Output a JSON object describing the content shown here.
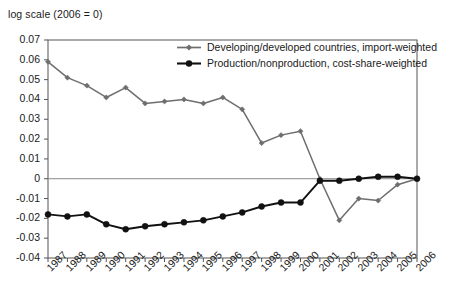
{
  "caption": "log scale (2006 = 0)",
  "legend": {
    "position": "top-center-right",
    "items": [
      {
        "label": "Developing/developed countries, import-weighted",
        "color": "#6e6e6e",
        "marker": "diamond",
        "icon": "line-marker-icon"
      },
      {
        "label": "Production/nonproduction, cost-share-weighted",
        "color": "#111111",
        "marker": "circle",
        "icon": "line-marker-icon"
      }
    ]
  },
  "chart_data": {
    "type": "line",
    "title": "",
    "subtitle": "",
    "xlabel": "",
    "ylabel": "log scale (2006 = 0)",
    "grid": false,
    "zero_line": true,
    "xlim": [
      1987,
      2006
    ],
    "ylim": [
      -0.04,
      0.07
    ],
    "ytick_labels": [
      "0.07",
      "0.06",
      "0.05",
      "0.04",
      "0.03",
      "0.02",
      "0.01",
      "0",
      "-0.01",
      "-0.02",
      "-0.03",
      "-0.04"
    ],
    "ytick_values": [
      0.07,
      0.06,
      0.05,
      0.04,
      0.03,
      0.02,
      0.01,
      0,
      -0.01,
      -0.02,
      -0.03,
      -0.04
    ],
    "categories": [
      "1987",
      "1988",
      "1989",
      "1990",
      "1991",
      "1992",
      "1993",
      "1994",
      "1995",
      "1996",
      "1997",
      "1998",
      "1999",
      "2000",
      "2001",
      "2002",
      "2003",
      "2004",
      "2005",
      "2006"
    ],
    "x": [
      1987,
      1988,
      1989,
      1990,
      1991,
      1992,
      1993,
      1994,
      1995,
      1996,
      1997,
      1998,
      1999,
      2000,
      2001,
      2002,
      2003,
      2004,
      2005,
      2006
    ],
    "series": [
      {
        "name": "Developing/developed countries, import-weighted",
        "color": "#6e6e6e",
        "marker": "diamond",
        "values": [
          0.059,
          0.051,
          0.047,
          0.041,
          0.046,
          0.038,
          0.039,
          0.04,
          0.038,
          0.041,
          0.035,
          0.018,
          0.022,
          0.024,
          0.0,
          -0.021,
          -0.01,
          -0.011,
          -0.003,
          0.0
        ]
      },
      {
        "name": "Production/nonproduction, cost-share-weighted",
        "color": "#111111",
        "marker": "circle",
        "values": [
          -0.018,
          -0.019,
          -0.018,
          -0.023,
          -0.0255,
          -0.024,
          -0.023,
          -0.022,
          -0.021,
          -0.019,
          -0.017,
          -0.014,
          -0.012,
          -0.012,
          -0.001,
          -0.001,
          0.0,
          0.001,
          0.001,
          0.0
        ]
      }
    ]
  },
  "plot_geometry": {
    "left": 48,
    "right": 417,
    "top": 40,
    "bottom": 258
  }
}
